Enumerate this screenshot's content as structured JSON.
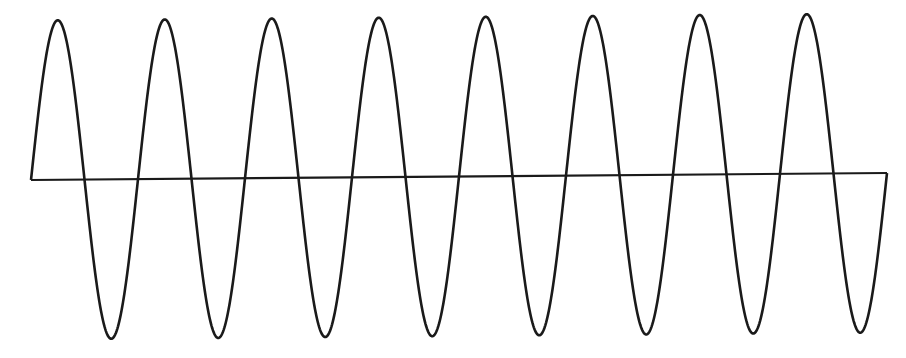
{
  "diagram": {
    "type": "sine-wave",
    "cycles": 8,
    "stroke_color": "#1a1a1a",
    "background_color": "#ffffff",
    "stroke_width": 2.6,
    "wave": {
      "x_start": 31,
      "x_end": 887,
      "baseline_y_start": 180,
      "baseline_y_end": 173,
      "amplitude_top_y": 17,
      "amplitude_bottom_y": 336
    },
    "axis": {
      "x1": 31,
      "y1": 180,
      "x2": 887,
      "y2": 173
    }
  }
}
